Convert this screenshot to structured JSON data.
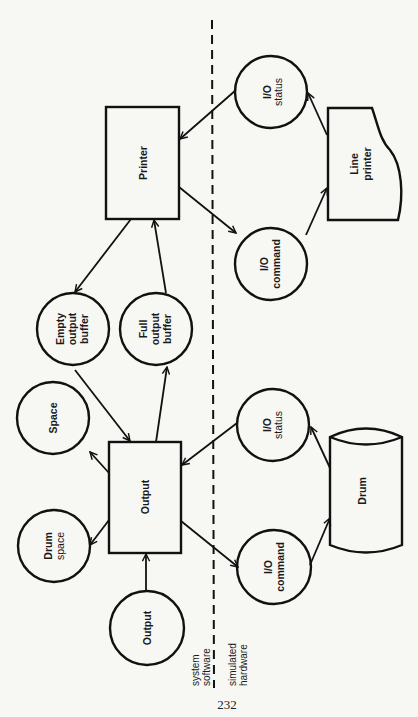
{
  "diagram": {
    "orientation": "rotated 90° counter-clockwise",
    "nodes": {
      "printer": {
        "label": "Printer",
        "shape": "rectangle"
      },
      "line_printer": {
        "label_lines": [
          "Line",
          "printer"
        ],
        "shape": "document"
      },
      "io_status_printer": {
        "label_lines": [
          "I/O",
          "status"
        ],
        "shape": "circle"
      },
      "io_command_printer": {
        "label_lines": [
          "I/O",
          "command"
        ],
        "shape": "circle"
      },
      "empty_output_buffer": {
        "label_lines": [
          "Empty",
          "output",
          "buffer"
        ],
        "shape": "circle"
      },
      "full_output_buffer": {
        "label_lines": [
          "Full",
          "output",
          "buffer"
        ],
        "shape": "circle"
      },
      "space": {
        "label": "Space",
        "shape": "circle"
      },
      "output_process": {
        "label": "Output",
        "shape": "rectangle"
      },
      "drum_space": {
        "label_lines": [
          "Drum",
          "space"
        ],
        "shape": "circle"
      },
      "io_status_drum": {
        "label_lines": [
          "I/O",
          "status"
        ],
        "shape": "circle"
      },
      "io_command_drum": {
        "label_lines": [
          "I/O",
          "command"
        ],
        "shape": "circle"
      },
      "output_input": {
        "label": "Output",
        "shape": "circle"
      },
      "drum": {
        "label": "Drum",
        "shape": "cylinder"
      }
    },
    "edges": [
      {
        "from": "io_status_printer",
        "to": "printer"
      },
      {
        "from": "printer",
        "to": "io_command_printer"
      },
      {
        "from": "io_command_printer",
        "to": "line_printer"
      },
      {
        "from": "line_printer",
        "to": "io_status_printer"
      },
      {
        "from": "printer",
        "to": "empty_output_buffer"
      },
      {
        "from": "full_output_buffer",
        "to": "printer"
      },
      {
        "from": "empty_output_buffer",
        "to": "output_process"
      },
      {
        "from": "output_process",
        "to": "full_output_buffer"
      },
      {
        "from": "output_process",
        "to": "space"
      },
      {
        "from": "output_process",
        "to": "drum_space"
      },
      {
        "from": "output_input",
        "to": "output_process"
      },
      {
        "from": "io_status_drum",
        "to": "output_process"
      },
      {
        "from": "output_process",
        "to": "io_command_drum"
      },
      {
        "from": "io_command_drum",
        "to": "drum"
      },
      {
        "from": "drum",
        "to": "io_status_drum"
      }
    ],
    "boundary": {
      "left_label_lines": [
        "system",
        "software"
      ],
      "right_label_lines": [
        "simulated",
        "hardware"
      ]
    }
  },
  "page_number": "232"
}
